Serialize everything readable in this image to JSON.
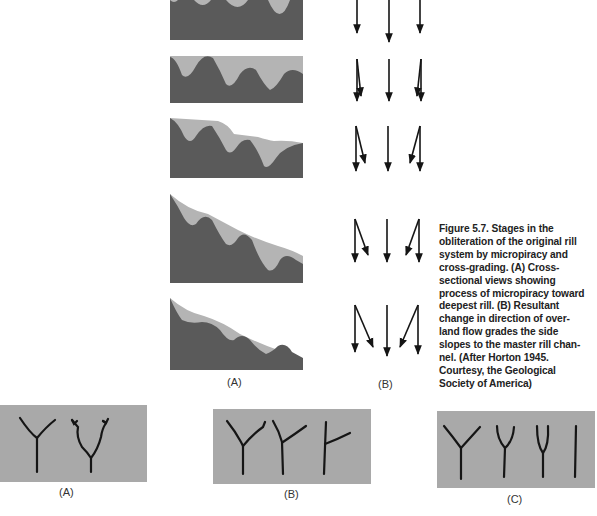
{
  "figure": {
    "caption": "Figure 5.7. Stages in the obliteration of the original rill system by micropiracy and cross-grading. (A) Cross-sectional views showing process of micropiracy toward deepest rill. (B) Resultant change in direction of overland flow grades the side slopes to the master rill channel. (After Horton 1945. Courtesy, the Geological Society of America)",
    "caption_lines": [
      "Figure 5.7.  Stages in the",
      "obliteration of the original rill",
      "system by micropiracy and",
      "cross-grading. (A) Cross-",
      "sectional views showing",
      "process of micropiracy toward",
      "deepest rill. (B) Resultant",
      "change in direction of over-",
      "land flow grades the side",
      "slopes to the master rill chan-",
      "nel. (After Horton 1945.",
      "Courtesy, the Geological",
      "Society of America)"
    ],
    "colors": {
      "soil_dark": "#5a5a5a",
      "soil_light": "#b4b4b4",
      "plan_bg": "#a9a9a9",
      "ink": "#151515"
    }
  },
  "cross_sections": {
    "label": "(A)",
    "stages": [
      {
        "stage": 1,
        "description": "Original rills, equal depth"
      },
      {
        "stage": 2,
        "description": "Early micropiracy"
      },
      {
        "stage": 3,
        "description": "Intermediate micropiracy"
      },
      {
        "stage": 4,
        "description": "Advanced grading toward deepest rill"
      },
      {
        "stage": 5,
        "description": "Graded to master rill"
      }
    ]
  },
  "flow_arrows": {
    "label": "(B)",
    "stages": [
      {
        "stage": 1,
        "left": "straight",
        "center": "straight",
        "right": "straight"
      },
      {
        "stage": 2,
        "left": "slight inward",
        "center": "straight",
        "right": "slight inward"
      },
      {
        "stage": 3,
        "left": "inward",
        "center": "straight",
        "right": "inward"
      },
      {
        "stage": 4,
        "left": "strong inward",
        "center": "straight",
        "right": "strong inward"
      },
      {
        "stage": 5,
        "left": "toward master",
        "center": "straight",
        "right": "toward master"
      }
    ]
  },
  "plan_views": [
    {
      "label": "(A)",
      "rills": 2
    },
    {
      "label": "(B)",
      "rills": 3
    },
    {
      "label": "(C)",
      "rills": 4
    }
  ]
}
